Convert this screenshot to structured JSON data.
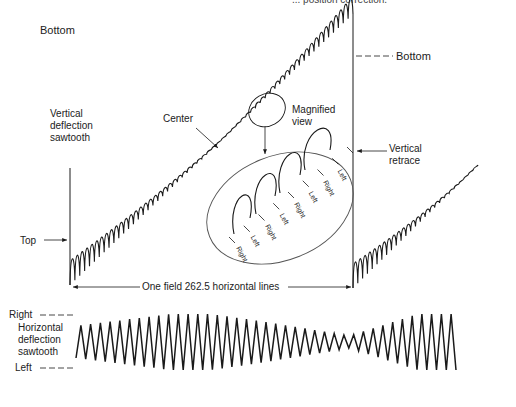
{
  "header": {
    "truncated_caption": "... position correction."
  },
  "vertical_waveform": {
    "label_bottom_left": "Bottom",
    "label_bottom_right": "Bottom",
    "label_top": "Top",
    "label_center": "Center",
    "label_vertical_deflection": "Vertical\ndeflection\nsawtooth",
    "label_vertical_retrace": "Vertical\nretrace",
    "label_magnified": "Magnified\nview",
    "field_span": "One field 262.5 horizontal lines"
  },
  "magnified_view": {
    "labels": [
      "Right",
      "Left",
      "Right",
      "Left",
      "Right",
      "Left",
      "Right",
      "Left"
    ]
  },
  "horizontal_waveform": {
    "label_right": "Right",
    "label_left": "Left",
    "label_horizontal_deflection": "Horizontal\ndeflection\nsawtooth"
  },
  "colors": {
    "ink": "#1a1a1a",
    "background": "#ffffff"
  }
}
